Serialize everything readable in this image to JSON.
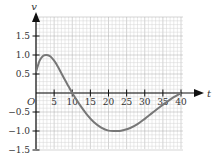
{
  "chart_data": {
    "type": "line",
    "title": "",
    "xlabel": "t",
    "ylabel": "v",
    "origin_label": "O",
    "xlim": [
      0,
      40
    ],
    "ylim": [
      -1.5,
      1.5
    ],
    "x_ticks": [
      5,
      10,
      15,
      20,
      25,
      30,
      35,
      40
    ],
    "x_tick_labels": [
      "5",
      "10",
      "15",
      "20",
      "25",
      "30",
      "35",
      "40"
    ],
    "y_ticks": [
      1.5,
      1.0,
      0.5,
      -0.5,
      -1.0,
      -1.5
    ],
    "y_tick_labels": [
      "1.5",
      "1.0",
      "0.5",
      "−0.5",
      "−1.0",
      "−1.5"
    ],
    "grid": true,
    "grid_minor_x": 1,
    "grid_minor_y": 0.1,
    "legend": null,
    "series": [
      {
        "name": "v(t)",
        "color": "#777777",
        "x": [
          0,
          1,
          2,
          3,
          4,
          5,
          6,
          7,
          8,
          9,
          10,
          12,
          14,
          16,
          18,
          20,
          22,
          23,
          24,
          26,
          28,
          30,
          32,
          34,
          36,
          38,
          40
        ],
        "values": [
          0.55,
          0.85,
          0.98,
          1.0,
          0.96,
          0.85,
          0.7,
          0.52,
          0.34,
          0.17,
          0.0,
          -0.3,
          -0.56,
          -0.77,
          -0.91,
          -0.99,
          -1.0,
          -1.0,
          -0.98,
          -0.92,
          -0.82,
          -0.68,
          -0.53,
          -0.38,
          -0.24,
          -0.11,
          0.0
        ]
      }
    ]
  },
  "colors": {
    "grid_minor": "#d4d4d4",
    "grid_major": "#a8a8a8",
    "axis": "#111111",
    "curve": "#777777"
  }
}
